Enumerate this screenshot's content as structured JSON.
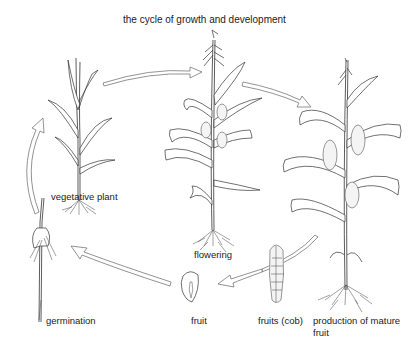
{
  "title": "the cycle of growth and development",
  "stages": [
    {
      "id": "vegetative",
      "label": "vegetative plant"
    },
    {
      "id": "flowering",
      "label": "flowering"
    },
    {
      "id": "mature",
      "label_line1": "production of mature",
      "label_line2": "fruit"
    },
    {
      "id": "cob",
      "label": "fruits (cob)"
    },
    {
      "id": "fruit",
      "label": "fruit"
    },
    {
      "id": "germination",
      "label": "germination"
    }
  ],
  "colors": {
    "line": "#333333",
    "arrow": "#777777",
    "background": "#ffffff"
  }
}
